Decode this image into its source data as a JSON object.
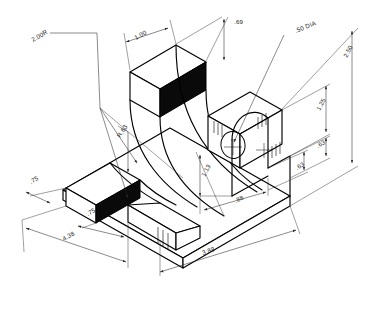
{
  "drawing": {
    "title": "isometric-bracket",
    "projection": "isometric",
    "line_color": "#000000",
    "dim_color": "#2b2b2b",
    "background": "#ffffff",
    "shaded_face_color": "#0a0a0a"
  },
  "dimensions": {
    "radius_note": "2.00R",
    "top_width": "1.00",
    "top_depth": ".69",
    "hole_note": ".50 DIA",
    "overall_height": "2.50",
    "right_upper": "1.25",
    "right_mid": ".63",
    "right_lower": ".63",
    "inner_height": "1.13",
    "inner_width": ".88",
    "fillet_radius": "R.63",
    "left_upper": ".75",
    "left_lower": ".75",
    "base_left": "4.38",
    "base_front": "3.88"
  },
  "labels": [
    {
      "id": "radius-note",
      "text": "2.00R",
      "x": 33,
      "y": 42,
      "rot": -30
    },
    {
      "id": "top-width",
      "text": "1.00",
      "x": 136,
      "y": 40,
      "rot": -30
    },
    {
      "id": "top-depth",
      "text": ".69",
      "x": 234,
      "y": 24,
      "rot": 0
    },
    {
      "id": "hole-dia-note",
      "text": ".50 DIA",
      "x": 299,
      "y": 32,
      "rot": -22
    },
    {
      "id": "overall-height",
      "text": "2.50",
      "x": 349,
      "y": 57,
      "rot": -62
    },
    {
      "id": "right-upper",
      "text": "1.25",
      "x": 322,
      "y": 110,
      "rot": -62
    },
    {
      "id": "right-mid",
      "text": ".63",
      "x": 318,
      "y": 148,
      "rot": -30
    },
    {
      "id": "right-lower",
      "text": ".63",
      "x": 298,
      "y": 170,
      "rot": -30
    },
    {
      "id": "inner-height",
      "text": "1.13",
      "x": 205,
      "y": 175,
      "rot": -62
    },
    {
      "id": "inner-width",
      "text": ".88",
      "x": 238,
      "y": 202,
      "rot": -28
    },
    {
      "id": "fillet-radius",
      "text": "R.63",
      "x": 120,
      "y": 138,
      "rot": -55
    },
    {
      "id": "left-upper",
      "text": ".75",
      "x": 33,
      "y": 184,
      "rot": -30
    },
    {
      "id": "left-lower",
      "text": ".75",
      "x": 90,
      "y": 215,
      "rot": -30
    },
    {
      "id": "base-left",
      "text": "4.38",
      "x": 66,
      "y": 240,
      "rot": -30
    },
    {
      "id": "base-front",
      "text": "3.88",
      "x": 205,
      "y": 254,
      "rot": -19
    }
  ],
  "geometry_notes": {
    "description": "Isometric bracket: L-shaped base with two curved arms sweeping up to an elevated block; a through hole is drilled in the upright rib on the right side.",
    "shaded_faces": 3,
    "curved_arms": 2,
    "hole_count": 1
  }
}
